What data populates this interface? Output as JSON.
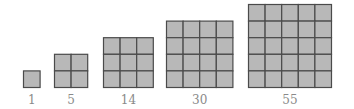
{
  "figure": {
    "colors": {
      "cell_fill": "#b8b8b8",
      "grid_line": "#4a4a4a",
      "label": "#8a8a8a"
    },
    "grids": [
      {
        "size": 1,
        "label": "1"
      },
      {
        "size": 2,
        "label": "5"
      },
      {
        "size": 3,
        "label": "14"
      },
      {
        "size": 4,
        "label": "30"
      },
      {
        "size": 5,
        "label": "55"
      }
    ]
  }
}
